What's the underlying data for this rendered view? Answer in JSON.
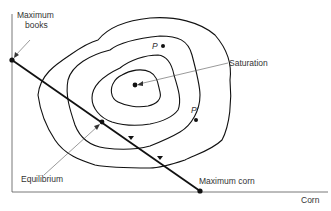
{
  "diagram": {
    "axes": {
      "x_label": "Corn",
      "y_label": ""
    },
    "labels": {
      "max_books": [
        "Maximum",
        "books"
      ],
      "saturation": "Saturation",
      "equilibrium": "Equilibrium",
      "max_corn": "Maximum corn",
      "p": "P",
      "p_prime": "P′"
    },
    "contours": 4,
    "budget_line": {
      "from": "Maximum books",
      "to": "Maximum corn"
    },
    "colors": {
      "line": "#111111",
      "label": "#333333",
      "axis": "#555555"
    }
  }
}
